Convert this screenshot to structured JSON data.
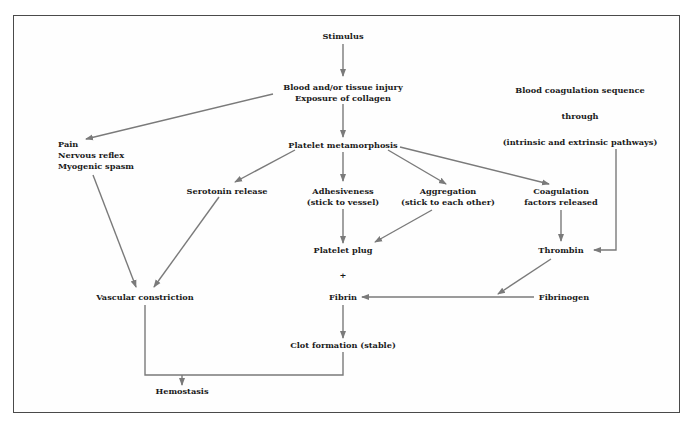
{
  "diagram": {
    "colors": {
      "arrow": "#7a7a7a",
      "text": "#1a1a1a",
      "border": "#4a4a4a"
    },
    "nodes": {
      "stimulus": "Stimulus",
      "injury_line1": "Blood and/or tissue injury",
      "injury_line2": "Exposure of collagen",
      "platelet_metamorphosis": "Platelet metamorphosis",
      "pain_line1": "Pain",
      "pain_line2": "Nervous reflex",
      "pain_line3": "Myogenic spasm",
      "serotonin": "Serotonin release",
      "adhesiveness_line1": "Adhesiveness",
      "adhesiveness_line2": "(stick to vessel)",
      "aggregation_line1": "Aggregation",
      "aggregation_line2": "(stick to each other)",
      "coag_factors_line1": "Coagulation",
      "coag_factors_line2": "factors released",
      "coag_seq_line1": "Blood coagulation sequence",
      "coag_seq_line2": "through",
      "coag_seq_line3": "(intrinsic and extrinsic pathways)",
      "platelet_plug": "Platelet plug",
      "plus": "+",
      "thrombin": "Thrombin",
      "vascular_constriction": "Vascular constriction",
      "fibrin": "Fibrin",
      "fibrinogen": "Fibrinogen",
      "clot_formation": "Clot formation (stable)",
      "hemostasis": "Hemostasis"
    },
    "edges": [
      {
        "from": "Stimulus",
        "to": "Blood and/or tissue injury"
      },
      {
        "from": "Blood and/or tissue injury",
        "to": "Platelet metamorphosis"
      },
      {
        "from": "Blood and/or tissue injury",
        "to": "Pain"
      },
      {
        "from": "Platelet metamorphosis",
        "to": "Serotonin release"
      },
      {
        "from": "Platelet metamorphosis",
        "to": "Adhesiveness"
      },
      {
        "from": "Platelet metamorphosis",
        "to": "Aggregation"
      },
      {
        "from": "Platelet metamorphosis",
        "to": "Coagulation factors released"
      },
      {
        "from": "Pain",
        "to": "Vascular constriction"
      },
      {
        "from": "Serotonin release",
        "to": "Vascular constriction"
      },
      {
        "from": "Adhesiveness",
        "to": "Platelet plug"
      },
      {
        "from": "Aggregation",
        "to": "Platelet plug"
      },
      {
        "from": "Coagulation factors released",
        "to": "Thrombin"
      },
      {
        "from": "Blood coagulation sequence",
        "to": "Thrombin"
      },
      {
        "from": "Thrombin",
        "to": "Fibrin"
      },
      {
        "from": "Fibrinogen",
        "to": "Fibrin"
      },
      {
        "from": "Fibrin",
        "to": "Clot formation (stable)"
      },
      {
        "from": "Vascular constriction",
        "to": "Hemostasis"
      },
      {
        "from": "Clot formation (stable)",
        "to": "Hemostasis"
      }
    ]
  }
}
